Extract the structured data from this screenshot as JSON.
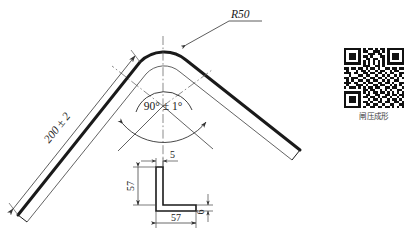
{
  "drawing": {
    "title": "bent-sheet-metal-part",
    "annotations": {
      "radius": "R50",
      "length": "200 ± 2",
      "angle": "90° ± 1°"
    },
    "section": {
      "web_thickness": "5",
      "vertical_height": "57",
      "flange_width": "57",
      "flange_thickness": "6"
    }
  },
  "qr": {
    "caption": "闸压成形",
    "modules": [
      "1111111010110101101111111",
      "1000001011001110101000001",
      "1011101000111011001011101",
      "1011101011010001101011101",
      "1011101001101100101011101",
      "1000001010101010101000001",
      "1111111010101010101111111",
      "0000000011100110100000000",
      "1101101101011010011011011",
      "0100010110100101100101100",
      "1110110011011011010110011",
      "0010001101100100101001010",
      "1101110010011011010110101",
      "0101001101101100101001100",
      "1110110010110011011010011",
      "0100011101001101100101010",
      "1011101010110110011011001",
      "0000000011011001010100110",
      "1111111010101101101010101",
      "1000001001100110011011011",
      "1011101011011010110100101",
      "1011101000101101001011010",
      "1011101011010011011001101",
      "1000001001101100100110011",
      "1111111010011011011010101"
    ]
  },
  "colors": {
    "line": "#1a1a1a",
    "thin": "#555555",
    "dim": "#4a4a4a",
    "qr_dark": "#111111",
    "background": "#ffffff"
  }
}
